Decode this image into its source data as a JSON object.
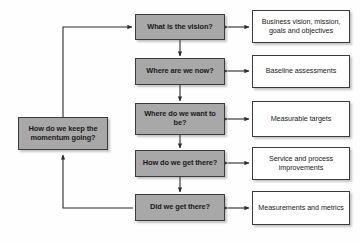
{
  "diagram": {
    "colors": {
      "process_fill": "#a8a8a8",
      "output_fill": "#ffffff",
      "border": "#3b3b3b",
      "background": "#fefefe",
      "connector": "#2b2b2b"
    },
    "feedback_node": {
      "label": "How do we keep the momentum going?"
    },
    "steps": [
      {
        "question": "What is the vision?",
        "output": "Business vision, mission, goals and objectives"
      },
      {
        "question": "Where are we now?",
        "output": "Baseline assessments"
      },
      {
        "question": "Where do we want to be?",
        "output": "Measurable targets"
      },
      {
        "question": "How do we get there?",
        "output": "Service and process improvements"
      },
      {
        "question": "Did we get there?",
        "output": "Measurements and metrics"
      }
    ]
  }
}
